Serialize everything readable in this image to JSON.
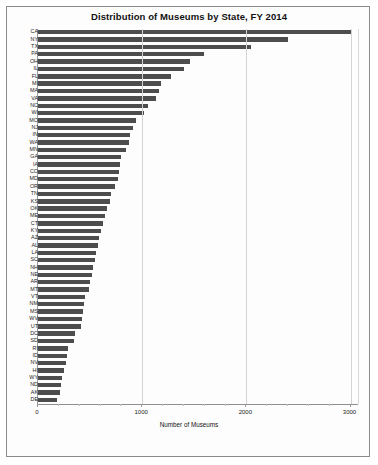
{
  "chart": {
    "title": "Distribution of Museums by State, FY 2014",
    "xlabel": "Number of Museums",
    "ylabel": ""
  },
  "chart_data": {
    "type": "bar",
    "orientation": "horizontal",
    "title": "Distribution of Museums by State, FY 2014",
    "xlabel": "Number of Museums",
    "ylabel": "",
    "xlim": [
      0,
      3072
    ],
    "xticks": [
      0,
      1000,
      2000,
      3000
    ],
    "xtick_labels": [
      "0",
      "1000",
      "2000",
      "3000"
    ],
    "grid": true,
    "legend": null,
    "bar_color": "#4d4d4d",
    "categories": [
      "CA",
      "NY",
      "TX",
      "PA",
      "OH",
      "IL",
      "FL",
      "MI",
      "MA",
      "VA",
      "NC",
      "WI",
      "MO",
      "NJ",
      "IN",
      "WA",
      "MN",
      "GA",
      "IA",
      "CO",
      "MD",
      "OR",
      "TN",
      "KS",
      "OK",
      "ME",
      "CT",
      "KY",
      "AZ",
      "AL",
      "LA",
      "SC",
      "NH",
      "NE",
      "AR",
      "MT",
      "VT",
      "NM",
      "MS",
      "WV",
      "UT",
      "DC",
      "SD",
      "RI",
      "ID",
      "NV",
      "HI",
      "WY",
      "ND",
      "AK",
      "DE"
    ],
    "values": [
      3014,
      2396,
      2043,
      1593,
      1455,
      1400,
      1279,
      1180,
      1164,
      1130,
      1060,
      1014,
      940,
      915,
      880,
      870,
      845,
      800,
      790,
      782,
      770,
      740,
      700,
      690,
      660,
      640,
      620,
      600,
      590,
      580,
      560,
      545,
      530,
      520,
      500,
      490,
      450,
      440,
      430,
      420,
      410,
      355,
      345,
      290,
      275,
      265,
      250,
      235,
      225,
      215,
      180
    ]
  },
  "ticks": {
    "t0": "0",
    "t1000": "1000",
    "t2000": "2000",
    "t3000": "3000"
  }
}
